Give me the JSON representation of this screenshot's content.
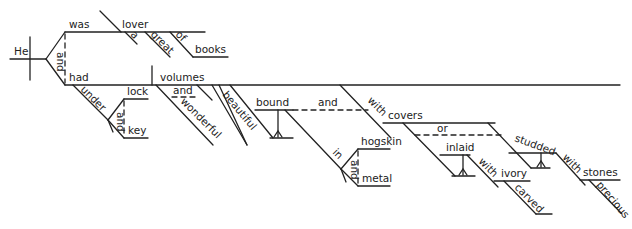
{
  "sentence_diagram": {
    "style": "Reed-Kellogg",
    "subject": "He",
    "compound_predicate_conjunction": "and",
    "clause_1": {
      "verb": "was",
      "predicate_nominative": "lover",
      "modifiers": [
        "a",
        "great"
      ],
      "prepositional_phrase": {
        "preposition": "of",
        "object": "books"
      }
    },
    "clause_2": {
      "verb": "had",
      "adverbial_phrase": {
        "preposition": "under",
        "compound_object": [
          "lock",
          "key"
        ],
        "conjunction": "and"
      },
      "direct_object": "volumes",
      "object_modifiers": {
        "compound_adjectives": [
          "wonderful"
        ],
        "adjective_conjunction": "and",
        "adjective": "beautiful"
      },
      "participles": {
        "conjunction": "and",
        "bound": {
          "word": "bound",
          "phrase": {
            "preposition": "in",
            "compound_object": [
              "hogskin",
              "metal"
            ],
            "conjunction": "and"
          }
        },
        "with_phrase": {
          "preposition": "with",
          "object": "covers",
          "conjunction": "or",
          "inlaid": {
            "word": "inlaid",
            "phrase": {
              "preposition": "with",
              "object": "ivory",
              "modifier": "carved"
            }
          },
          "studded": {
            "word": "studded",
            "phrase": {
              "preposition": "with",
              "object": "stones",
              "modifier": "precious"
            }
          }
        }
      }
    }
  }
}
